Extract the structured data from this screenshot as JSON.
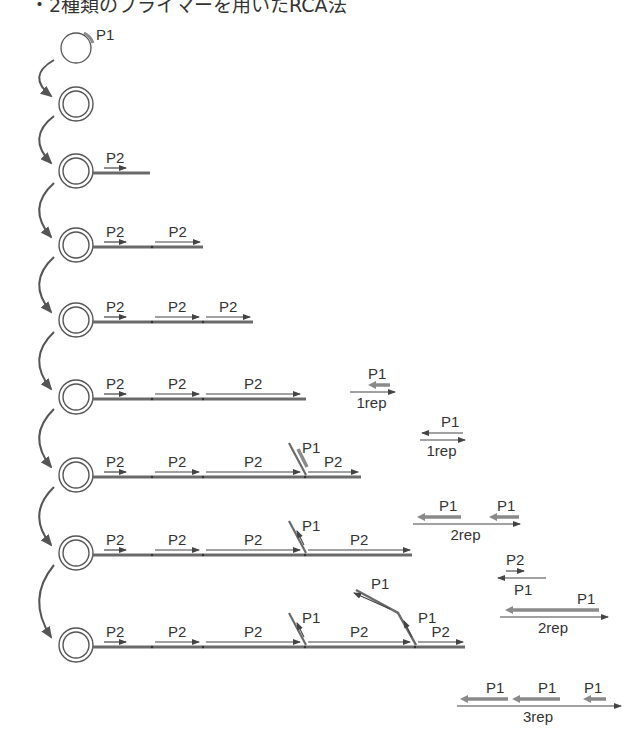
{
  "title": "・2種類のプライマーを用いたRCA法",
  "colors": {
    "ink": "#444444",
    "strand": "#6a6a6a",
    "primer": "#8a8a8a",
    "arrow": "#555555"
  },
  "circle_x": 76,
  "rows": [
    {
      "y": 48,
      "type": "single",
      "primer_label": "P1"
    },
    {
      "y": 104,
      "type": "double"
    },
    {
      "y": 171,
      "type": "double",
      "tail_end": 150,
      "p2": [
        {
          "x1": 104,
          "x2": 126,
          "label": "P2"
        }
      ]
    },
    {
      "y": 245,
      "type": "double",
      "tail_end": 203,
      "p2": [
        {
          "x1": 104,
          "x2": 126,
          "label": "P2"
        },
        {
          "x1": 155,
          "x2": 200,
          "label": "P2"
        }
      ]
    },
    {
      "y": 320,
      "type": "double",
      "tail_end": 253,
      "p2": [
        {
          "x1": 104,
          "x2": 126,
          "label": "P2"
        },
        {
          "x1": 155,
          "x2": 199,
          "label": "P2"
        },
        {
          "x1": 206,
          "x2": 250,
          "label": "P2"
        }
      ]
    },
    {
      "y": 397,
      "type": "double",
      "tail_end": 306,
      "p2": [
        {
          "x1": 104,
          "x2": 126,
          "label": "P2"
        },
        {
          "x1": 155,
          "x2": 199,
          "label": "P2"
        },
        {
          "x1": 206,
          "x2": 300,
          "label": "P2"
        }
      ]
    },
    {
      "y": 475,
      "type": "double",
      "tail_end": 361,
      "p2": [
        {
          "x1": 104,
          "x2": 126,
          "label": "P2"
        },
        {
          "x1": 155,
          "x2": 199,
          "label": "P2"
        },
        {
          "x1": 206,
          "x2": 300,
          "label": "P2"
        },
        {
          "x1": 308,
          "x2": 358,
          "label": "P2"
        }
      ],
      "branches": [
        {
          "x": 306,
          "label": "P1",
          "style": "thick"
        }
      ]
    },
    {
      "y": 553,
      "type": "double",
      "tail_end": 412,
      "p2": [
        {
          "x1": 104,
          "x2": 126,
          "label": "P2"
        },
        {
          "x1": 155,
          "x2": 199,
          "label": "P2"
        },
        {
          "x1": 206,
          "x2": 300,
          "label": "P2"
        },
        {
          "x1": 308,
          "x2": 410,
          "label": "P2"
        }
      ],
      "branches": [
        {
          "x": 306,
          "label": "P1",
          "style": "thin"
        }
      ]
    },
    {
      "y": 645,
      "type": "double",
      "tail_end": 465,
      "p2": [
        {
          "x1": 104,
          "x2": 126,
          "label": "P2"
        },
        {
          "x1": 155,
          "x2": 199,
          "label": "P2"
        },
        {
          "x1": 206,
          "x2": 300,
          "label": "P2"
        },
        {
          "x1": 308,
          "x2": 410,
          "label": "P2"
        },
        {
          "x1": 418,
          "x2": 463,
          "label": "P2"
        }
      ],
      "branches": [
        {
          "x": 306,
          "label": "P1",
          "style": "thin"
        },
        {
          "x": 416,
          "label": "P1",
          "style": "long"
        }
      ]
    }
  ],
  "products": [
    {
      "x1": 350,
      "x2": 395,
      "y": 392,
      "rep": "1rep",
      "p1": [
        {
          "x1": 368,
          "x2": 390,
          "thick": true,
          "label": "P1"
        }
      ]
    },
    {
      "x1": 420,
      "x2": 465,
      "y": 440,
      "rep": "1rep",
      "p1": [
        {
          "x1": 422,
          "x2": 463,
          "thick": false,
          "label": "P1"
        }
      ]
    },
    {
      "x1": 413,
      "x2": 520,
      "y": 524,
      "rep": "2rep",
      "p1": [
        {
          "x1": 417,
          "x2": 461,
          "thick": true,
          "label": "P1"
        },
        {
          "x1": 489,
          "x2": 519,
          "thick": true,
          "label": "P1"
        }
      ]
    },
    {
      "x1": 498,
      "x2": 546,
      "y": 578,
      "rep": "",
      "p2_above": {
        "x1": 506,
        "x2": 524,
        "label": "P2"
      },
      "label_below": "P1",
      "reverse": true
    },
    {
      "x1": 500,
      "x2": 608,
      "y": 617,
      "rep": "2rep",
      "p1": [
        {
          "x1": 505,
          "x2": 599,
          "thick": true,
          "label": "P1"
        }
      ]
    },
    {
      "x1": 457,
      "x2": 621,
      "y": 706,
      "rep": "3rep",
      "p1": [
        {
          "x1": 460,
          "x2": 508,
          "thick": true,
          "label": "P1"
        },
        {
          "x1": 512,
          "x2": 560,
          "thick": true,
          "label": "P1"
        },
        {
          "x1": 583,
          "x2": 606,
          "thick": true,
          "label": "P1"
        }
      ]
    }
  ]
}
